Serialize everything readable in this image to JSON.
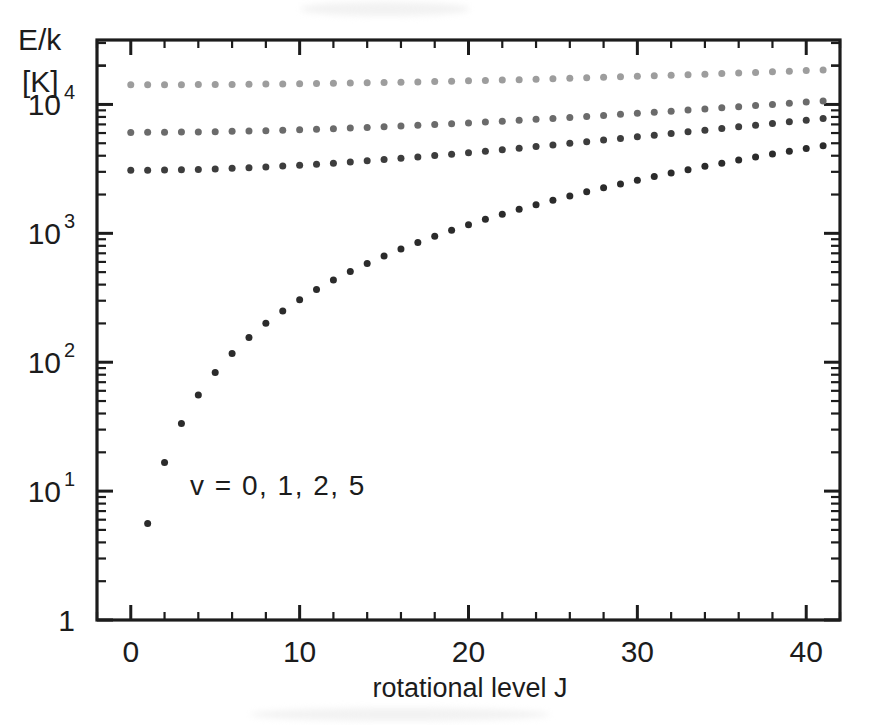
{
  "figure": {
    "background_color": "#ffffff",
    "frame_color": "#1c1c1c",
    "corner_label_line1": "E/k",
    "corner_label_line2": "[K]",
    "annotation": "v = 0, 1, 2, 5"
  },
  "chart_data": {
    "type": "scatter",
    "title": "",
    "subtitle": "",
    "xlabel": "rotational level J",
    "ylabel": "E/k [K]",
    "yscale": "log",
    "xscale": "linear",
    "xlim": [
      -2,
      42
    ],
    "ylim": [
      1,
      31623
    ],
    "grid": false,
    "legend_position": "inside-annotation",
    "xticks_major": [
      0,
      10,
      20,
      30,
      40
    ],
    "xticks_major_labels": [
      "0",
      "10",
      "20",
      "30",
      "40"
    ],
    "xtick_minor_step": 2,
    "yticks_major": [
      1,
      10,
      100,
      1000,
      10000
    ],
    "yticks_major_labels": [
      "1",
      "10",
      "10",
      "10",
      "10"
    ],
    "ytick_exponents": [
      "",
      "1",
      "2",
      "3",
      "4"
    ],
    "marker": "circle",
    "marker_size_px": 7,
    "x": [
      0,
      1,
      2,
      3,
      4,
      5,
      6,
      7,
      8,
      9,
      10,
      11,
      12,
      13,
      14,
      15,
      16,
      17,
      18,
      19,
      20,
      21,
      22,
      23,
      24,
      25,
      26,
      27,
      28,
      29,
      30,
      31,
      32,
      33,
      34,
      35,
      36,
      37,
      38,
      39,
      40,
      41
    ],
    "series": [
      {
        "name": "v = 0",
        "v": 0,
        "color": "#2b2b2b",
        "origin": 0.0,
        "rotational_constant_K": 2.78,
        "values": [
          0,
          5.6,
          16.7,
          33.4,
          55.6,
          83.4,
          116.8,
          155.7,
          200.2,
          250.2,
          305.8,
          367.0,
          433.7,
          505.9,
          583.8,
          667.2,
          756.2,
          850.7,
          950.8,
          1056.4,
          1167.6,
          1284.4,
          1406.7,
          1534.6,
          1668.0,
          1807.0,
          1951.6,
          2101.7,
          2257.3,
          2418.6,
          2585.4,
          2757.7,
          2935.6,
          3119.1,
          3308.1,
          3502.7,
          3702.8,
          3908.5,
          4119.8,
          4336.6,
          4559.0,
          4787.0
        ]
      },
      {
        "name": "v = 1",
        "v": 1,
        "color": "#3d3d3d",
        "origin": 3080,
        "rotational_constant_K": 2.72,
        "values": [
          3080,
          3085,
          3096,
          3113,
          3134,
          3162,
          3194,
          3232,
          3276,
          3325,
          3379,
          3439,
          3504,
          3575,
          3651,
          3733,
          3820,
          3913,
          4011,
          4114,
          4223,
          4337,
          4457,
          4582,
          4713,
          4849,
          4990,
          5137,
          5289,
          5447,
          5610,
          5779,
          5953,
          6132,
          6317,
          6508,
          6704,
          6905,
          7112,
          7325,
          7542,
          7766
        ]
      },
      {
        "name": "v = 2",
        "v": 2,
        "color": "#6b6b6b",
        "origin": 6070,
        "rotational_constant_K": 2.66,
        "values": [
          6070,
          6075,
          6086,
          6102,
          6123,
          6150,
          6182,
          6219,
          6261,
          6309,
          6362,
          6420,
          6484,
          6553,
          6627,
          6707,
          6792,
          6882,
          6978,
          7078,
          7185,
          7296,
          7413,
          7535,
          7662,
          7795,
          7933,
          8076,
          8225,
          8379,
          8538,
          8703,
          8873,
          9048,
          9229,
          9415,
          9606,
          9803,
          10005,
          10213,
          10426,
          10644
        ]
      },
      {
        "name": "v = 5",
        "v": 5,
        "color": "#9d9d9d",
        "origin": 14200,
        "rotational_constant_K": 2.5,
        "values": [
          14200,
          14205,
          14215,
          14230,
          14250,
          14275,
          14305,
          14340,
          14380,
          14425,
          14475,
          14530,
          14590,
          14655,
          14725,
          14800,
          14880,
          14965,
          15055,
          15150,
          15250,
          15355,
          15465,
          15580,
          15700,
          15825,
          15955,
          16090,
          16230,
          16375,
          16525,
          16680,
          16840,
          17005,
          17175,
          17350,
          17530,
          17715,
          17905,
          18100,
          18300,
          18505
        ]
      }
    ]
  }
}
